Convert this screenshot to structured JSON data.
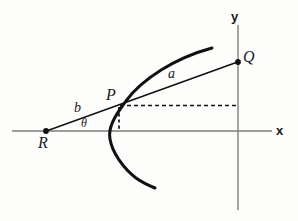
{
  "figure": {
    "type": "geometry-diagram",
    "background_color": "#fdfdfc",
    "axis_color": "#7d7d7d",
    "ink_color": "#111111"
  },
  "axes": {
    "x_axis": {
      "label": "x",
      "label_x": 281,
      "label_y": 130,
      "y_pixel": 131,
      "x_start": 12,
      "x_end": 272
    },
    "y_axis": {
      "label": "y",
      "label_x": 235,
      "label_y": 16,
      "x_pixel": 238,
      "y_start": 25,
      "y_end": 210
    }
  },
  "points": [
    {
      "name": "R",
      "label": "R",
      "x": 46,
      "y": 131,
      "dot": true,
      "label_x": 44,
      "label_y": 145,
      "note": "on x-axis, left of vertex"
    },
    {
      "name": "P",
      "label": "P",
      "x": 118,
      "y": 106,
      "dot": false,
      "label_x": 113,
      "label_y": 96,
      "note": "on the parabola, on line RQ"
    },
    {
      "name": "Q",
      "label": "Q",
      "x": 238,
      "y": 62,
      "dot": true,
      "label_x": 247,
      "label_y": 59,
      "note": "on y-axis"
    }
  ],
  "segments": [
    {
      "name": "b",
      "label": "b",
      "from": "R",
      "to": "P",
      "label_x": 79,
      "label_y": 110,
      "style": "solid"
    },
    {
      "name": "a",
      "label": "a",
      "from": "P",
      "to": "Q",
      "label_x": 174,
      "label_y": 76,
      "style": "solid"
    }
  ],
  "angles": [
    {
      "name": "theta",
      "label": "θ",
      "at": "R",
      "between": [
        "x-axis",
        "RQ"
      ],
      "label_x": 86,
      "label_y": 125
    }
  ],
  "dashed_lines": [
    {
      "name": "p-to-x-axis",
      "orientation": "vertical",
      "x": 119,
      "y_from": 107,
      "y_to": 131
    },
    {
      "name": "p-to-y-axis",
      "orientation": "horizontal",
      "y": 106,
      "x_from": 120,
      "x_to": 238
    }
  ],
  "curve": {
    "name": "parabola",
    "opens": "right",
    "vertex_x": 110,
    "vertex_y": 135,
    "upper_end_x": 212,
    "upper_end_y": 48,
    "lower_end_x": 155,
    "lower_end_y": 188,
    "stroke_width": 3
  }
}
